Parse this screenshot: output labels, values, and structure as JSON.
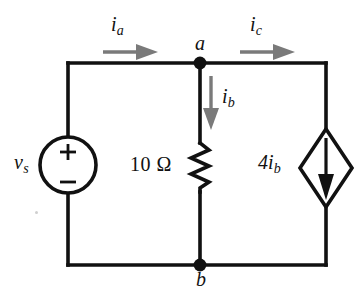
{
  "figure": {
    "name": "dc-circuit-schematic",
    "background_color": "#ffffff",
    "wire_color": "#111111",
    "arrow_color": "#7a7a7a",
    "width": 363,
    "height": 300
  },
  "labels": {
    "current_ia": "i",
    "current_ia_sub": "a",
    "current_ic": "i",
    "current_ic_sub": "c",
    "current_ib": "i",
    "current_ib_sub": "b",
    "node_a": "a",
    "node_b": "b",
    "source_vs": "v",
    "source_vs_sub": "s",
    "resistor": "10 Ω",
    "dependent_source": "4i",
    "dependent_source_sub": "b",
    "polarity_plus": "+",
    "polarity_minus": "−"
  },
  "components": [
    {
      "name": "independent-voltage-source",
      "type": "voltage-source",
      "symbol": "circle",
      "label": "v_s",
      "polarity_top": "+",
      "polarity_bottom": "−",
      "branch": "left"
    },
    {
      "name": "resistor-10-ohm",
      "type": "resistor",
      "symbol": "zigzag",
      "label": "10 Ω",
      "value": 10,
      "unit": "Ω",
      "branch": "middle"
    },
    {
      "name": "dependent-current-source",
      "type": "dependent-current-source",
      "symbol": "diamond",
      "label": "4i_b",
      "gain": 4,
      "controlling_current": "i_b",
      "arrow_direction": "down",
      "branch": "right"
    }
  ],
  "nodes": [
    {
      "name": "node-a",
      "label": "a",
      "position": "top-middle"
    },
    {
      "name": "node-b",
      "label": "b",
      "position": "bottom-middle"
    }
  ],
  "currents": [
    {
      "name": "current-ia",
      "label": "i_a",
      "direction": "right",
      "branch": "top-left"
    },
    {
      "name": "current-ic",
      "label": "i_c",
      "direction": "right",
      "branch": "top-right"
    },
    {
      "name": "current-ib",
      "label": "i_b",
      "direction": "down",
      "branch": "middle"
    }
  ]
}
